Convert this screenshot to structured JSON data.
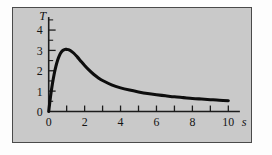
{
  "figure": {
    "panel_background": "#c9c9c9",
    "panel_border_color": "#4a4a4a",
    "page_background": "#ffffff",
    "curve_color": "#0d0d0d",
    "axis_color": "#1c1c1c"
  },
  "chart_data": {
    "type": "line",
    "title": "",
    "xlabel": "s",
    "ylabel": "T",
    "xlim": [
      0,
      10.6
    ],
    "ylim": [
      0,
      4.6
    ],
    "grid": false,
    "legend": null,
    "x_ticks_major": [
      0,
      1,
      2,
      3,
      4,
      5,
      6,
      7,
      8,
      9,
      10
    ],
    "x_tick_labels": [
      {
        "value": 0,
        "label": "0"
      },
      {
        "value": 2,
        "label": "2"
      },
      {
        "value": 4,
        "label": "4"
      },
      {
        "value": 6,
        "label": "6"
      },
      {
        "value": 8,
        "label": "8"
      },
      {
        "value": 10,
        "label": "10"
      }
    ],
    "y_ticks_major": [
      0,
      1,
      2,
      3,
      4
    ],
    "y_ticks_minor": [
      0.5,
      1.5,
      2.5,
      3.5,
      4.5
    ],
    "y_tick_labels": [
      {
        "value": 0,
        "label": "0"
      },
      {
        "value": 1,
        "label": "1"
      },
      {
        "value": 2,
        "label": "2"
      },
      {
        "value": 3,
        "label": "3"
      },
      {
        "value": 4,
        "label": "4"
      }
    ],
    "peak": {
      "x": 1.1,
      "y": 3.05
    },
    "x": [
      0.0,
      0.1,
      0.2,
      0.3,
      0.4,
      0.5,
      0.6,
      0.7,
      0.8,
      0.9,
      1.0,
      1.1,
      1.2,
      1.4,
      1.6,
      1.8,
      2.0,
      2.25,
      2.5,
      2.75,
      3.0,
      3.5,
      4.0,
      4.5,
      5.0,
      5.5,
      6.0,
      6.5,
      7.0,
      7.5,
      8.0,
      8.5,
      9.0,
      9.5,
      10.0
    ],
    "y": [
      0.0,
      0.72,
      1.32,
      1.82,
      2.22,
      2.53,
      2.76,
      2.92,
      3.01,
      3.05,
      3.05,
      3.04,
      3.0,
      2.86,
      2.67,
      2.46,
      2.26,
      2.03,
      1.83,
      1.66,
      1.52,
      1.31,
      1.16,
      1.05,
      0.96,
      0.88,
      0.82,
      0.77,
      0.72,
      0.68,
      0.64,
      0.61,
      0.58,
      0.55,
      0.53
    ],
    "series_name": "T(s)"
  }
}
